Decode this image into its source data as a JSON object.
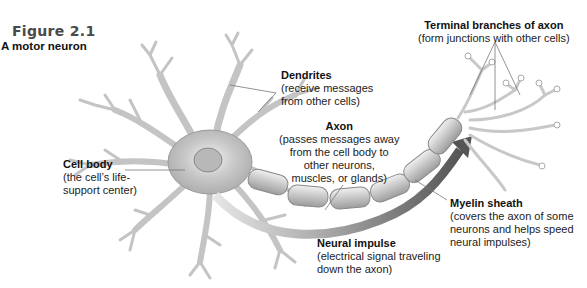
{
  "figure": {
    "number": "Figure 2.1",
    "title": "A motor neuron"
  },
  "labels": {
    "terminal": {
      "title": "Terminal branches of axon",
      "desc": [
        "(form junctions with other cells)"
      ]
    },
    "dendrites": {
      "title": "Dendrites",
      "desc": [
        "(receive messages",
        "from other cells)"
      ]
    },
    "axon": {
      "title": "Axon",
      "desc": [
        "(passes messages away",
        "from the cell body to",
        "other neurons,",
        "muscles, or glands)"
      ]
    },
    "cell_body": {
      "title": "Cell body",
      "desc": [
        "(the cell’s life-",
        "support center)"
      ]
    },
    "myelin": {
      "title": "Myelin sheath",
      "desc": [
        "(covers the axon of some",
        "neurons and helps speed",
        "neural impulses)"
      ]
    },
    "impulse": {
      "title": "Neural impulse",
      "desc": [
        "(electrical signal traveling",
        "down the axon)"
      ]
    }
  },
  "colors": {
    "neuron_fill": "#d4d4d4",
    "neuron_stroke": "#9a9a9a",
    "impulse_arrow": "#5a5a5a",
    "leader_line": "#777777"
  }
}
